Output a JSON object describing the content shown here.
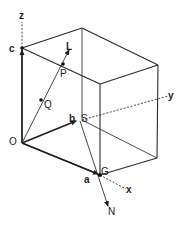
{
  "diagram": {
    "title": "",
    "colors": {
      "line": "#2a2a2a",
      "label": "#222222",
      "background": "#ffffff"
    },
    "axes": {
      "z": {
        "label": "z"
      },
      "y": {
        "label": "y"
      },
      "x": {
        "label": "x"
      }
    },
    "points": {
      "origin": {
        "label": "O"
      },
      "a": {
        "label": "a"
      },
      "b": {
        "label": "b"
      },
      "c": {
        "label": "c"
      },
      "P": {
        "label": "P"
      },
      "Q": {
        "label": "Q"
      },
      "S": {
        "label": "S"
      },
      "G": {
        "label": "G"
      },
      "L": {
        "label": "L"
      },
      "N": {
        "label": "N"
      }
    }
  }
}
